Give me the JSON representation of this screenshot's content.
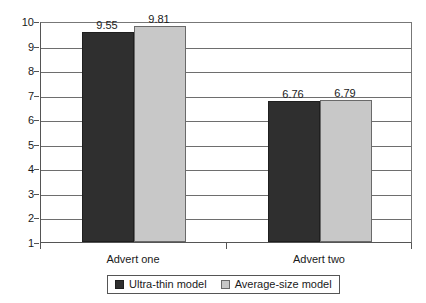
{
  "chart_data": {
    "type": "bar",
    "title": "",
    "subtitle": "",
    "xlabel": "",
    "ylabel": "",
    "categories": [
      "Advert one",
      "Advert two"
    ],
    "series": [
      {
        "name": "Ultra-thin model",
        "color": "#2f2f2f",
        "values": [
          9.55,
          6.76
        ]
      },
      {
        "name": "Average-size model",
        "color": "#c8c8c8",
        "values": [
          9.81,
          6.79
        ]
      }
    ],
    "value_labels": [
      [
        "9.55",
        "9.81"
      ],
      [
        "6.76",
        "6.79"
      ]
    ],
    "ylim": [
      1,
      10
    ],
    "y_ticks": [
      1,
      2,
      3,
      4,
      5,
      6,
      7,
      8,
      9,
      10
    ],
    "y_tick_labels": [
      "1",
      "2",
      "3",
      "4",
      "5",
      "6",
      "7",
      "8",
      "9",
      "10"
    ],
    "grid": true,
    "grid_axis": "y",
    "legend_position": "bottom-center",
    "legend_boxed": true
  },
  "axes": {
    "y_tick_labels": [
      "10",
      "9",
      "8",
      "7",
      "6",
      "5",
      "4",
      "3",
      "2",
      "1"
    ],
    "x_category_labels": [
      "Advert one",
      "Advert two"
    ]
  },
  "legend": {
    "items": [
      {
        "label": "Ultra-thin model",
        "swatch": "dark"
      },
      {
        "label": "Average-size model",
        "swatch": "light"
      }
    ]
  },
  "colors": {
    "series_dark": "#2f2f2f",
    "series_light": "#c8c8c8",
    "axis": "#555555",
    "gridline": "#6e6e6e",
    "text": "#1a1a1a",
    "background": "#ffffff"
  }
}
